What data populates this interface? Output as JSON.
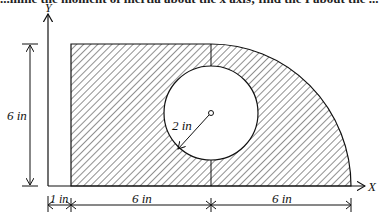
{
  "header_text": "...mine the moment of inertia about the x axis; find the I about the ...",
  "diagram": {
    "axes": {
      "x_label": "X",
      "y_label": "Y"
    },
    "dimensions": {
      "height": "6 in",
      "left_offset": "1 in",
      "rect_width": "6 in",
      "quarter_radius": "6 in",
      "hole_radius": "2 in"
    },
    "colors": {
      "stroke": "#111111",
      "hatch": "#333333",
      "background": "#ffffff"
    }
  }
}
